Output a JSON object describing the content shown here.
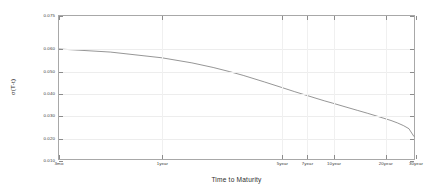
{
  "chart_data": {
    "type": "line",
    "title": "",
    "xlabel": "Time to Maturity",
    "ylabel": "σ(T-t)",
    "grid": true,
    "legend": false,
    "ylim": [
      0.01,
      0.075
    ],
    "ytick_values": [
      0.01,
      0.02,
      0.03,
      0.04,
      0.05,
      0.06,
      0.075
    ],
    "ytick_labels": [
      "0.010",
      "0.020",
      "0.030",
      "0.040",
      "0.050",
      "0.060",
      "0.075"
    ],
    "xlim_years": [
      0.25,
      30
    ],
    "xtick_values": [
      0.25,
      1,
      5,
      7,
      10,
      20,
      30
    ],
    "xtick_labels": [
      "3mo",
      "1year",
      "5year",
      "7year",
      "10year",
      "20year",
      "30year"
    ],
    "series": [
      {
        "name": "volatility",
        "color": "#4d4d4d",
        "x": [
          0.25,
          0.5,
          1,
          1.5,
          2,
          2.5,
          3,
          4,
          5,
          6,
          7,
          8,
          9,
          10,
          12,
          14,
          16,
          18,
          20,
          22,
          24,
          26,
          28,
          30
        ],
        "y": [
          0.06,
          0.0586,
          0.056,
          0.0537,
          0.0516,
          0.0497,
          0.048,
          0.045,
          0.0426,
          0.0406,
          0.039,
          0.0376,
          0.0364,
          0.0354,
          0.0336,
          0.0321,
          0.0308,
          0.0296,
          0.0285,
          0.0275,
          0.0264,
          0.0252,
          0.0238,
          0.0202
        ]
      }
    ]
  }
}
